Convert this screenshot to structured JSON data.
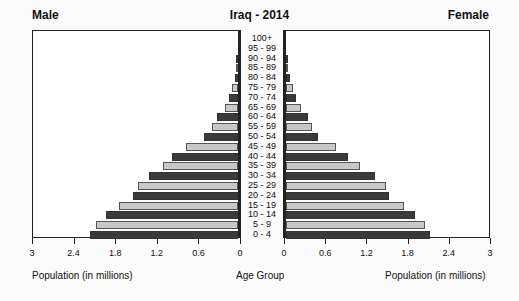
{
  "chart_data": {
    "type": "bar",
    "subtype": "population-pyramid",
    "title": "Iraq - 2014",
    "left_label": "Male",
    "right_label": "Female",
    "xlabel_left": "Population (in millions)",
    "xlabel_center": "Age Group",
    "xlabel_right": "Population (in millions)",
    "xlim": [
      0,
      3
    ],
    "ticks": [
      "0",
      "0.6",
      "1.2",
      "1.8",
      "2.4",
      "3"
    ],
    "categories": [
      "0 - 4",
      "5 - 9",
      "10 - 14",
      "15 - 19",
      "20 - 24",
      "25 - 29",
      "30 - 34",
      "35 - 39",
      "40 - 44",
      "45 - 49",
      "50 - 54",
      "55 - 59",
      "60 - 64",
      "65 - 69",
      "70 - 74",
      "75 - 79",
      "80 - 84",
      "85 - 89",
      "90 - 94",
      "95 - 99",
      "100+"
    ],
    "series": [
      {
        "name": "Male",
        "values": [
          2.14,
          2.05,
          1.9,
          1.71,
          1.51,
          1.44,
          1.28,
          1.08,
          0.95,
          0.75,
          0.49,
          0.37,
          0.3,
          0.19,
          0.13,
          0.09,
          0.05,
          0.02,
          0.01,
          0.0,
          0.0
        ]
      },
      {
        "name": "Female",
        "values": [
          2.1,
          2.02,
          1.88,
          1.72,
          1.5,
          1.46,
          1.3,
          1.08,
          0.9,
          0.73,
          0.46,
          0.38,
          0.32,
          0.22,
          0.15,
          0.1,
          0.06,
          0.02,
          0.01,
          0.0,
          0.0
        ]
      }
    ],
    "colors": {
      "dark": "#3a3a3a",
      "light": "#c8c8c8"
    },
    "grid": false
  }
}
